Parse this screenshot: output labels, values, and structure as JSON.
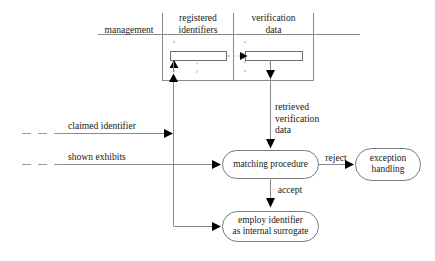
{
  "diagram": {
    "colors": {
      "line": "#8a8a8a",
      "line_dark": "#555555",
      "text": "#1a1a1a",
      "arrowhead": "#000000",
      "background": "#ffffff"
    },
    "swimlane_headers": [
      {
        "id": "management",
        "label": "management"
      },
      {
        "id": "registered-identifiers",
        "label": "registered\nidentifiers"
      },
      {
        "id": "verification-data",
        "label": "verification\ndata"
      }
    ],
    "store_columns": [
      {
        "id": "registered-identifiers-store",
        "label": "",
        "ellipsis": "⋮"
      },
      {
        "id": "verification-data-store",
        "label": "",
        "ellipsis": "⋮"
      }
    ],
    "input_flows": [
      {
        "id": "claimed-identifier",
        "label": "claimed identifier"
      },
      {
        "id": "shown-exhibits",
        "label": "shown exhibits"
      }
    ],
    "edge_labels": [
      {
        "id": "retrieved-verification-data",
        "label": "retrieved\nverification\ndata"
      },
      {
        "id": "reject",
        "label": "reject"
      },
      {
        "id": "accept",
        "label": "accept"
      }
    ],
    "process_nodes": [
      {
        "id": "matching-procedure",
        "label": "matching procedure"
      },
      {
        "id": "exception-handling",
        "label": "exception\nhandling"
      },
      {
        "id": "employ-identifier",
        "label": "employ identifier\nas internal surrogate"
      }
    ]
  }
}
